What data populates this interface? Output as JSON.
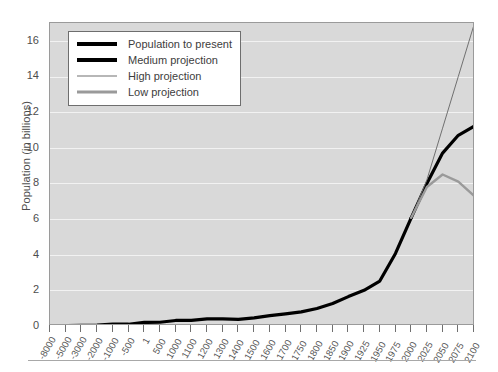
{
  "chart_data": {
    "type": "line",
    "title": "",
    "xlabel": "",
    "ylabel": "Population (in billions)",
    "ylim": [
      0,
      17
    ],
    "yticks": [
      0,
      2,
      4,
      6,
      8,
      10,
      12,
      14,
      16
    ],
    "grid": true,
    "legend_position": "top-left",
    "categories": [
      "-8000",
      "-5000",
      "-3000",
      "-2000",
      "-1000",
      "-500",
      "1",
      "500",
      "1000",
      "1100",
      "1200",
      "1300",
      "1400",
      "1500",
      "1600",
      "1700",
      "1750",
      "1800",
      "1850",
      "1900",
      "1925",
      "1950",
      "1975",
      "2000",
      "2025",
      "2050",
      "2075",
      "2100"
    ],
    "series": [
      {
        "name": "Population to present",
        "color": "#000000",
        "width": 3.2,
        "values": [
          0.005,
          0.02,
          0.04,
          0.05,
          0.1,
          0.1,
          0.2,
          0.21,
          0.31,
          0.32,
          0.4,
          0.4,
          0.37,
          0.46,
          0.58,
          0.68,
          0.79,
          0.98,
          1.26,
          1.65,
          2.0,
          2.52,
          4.07,
          6.07,
          null,
          null,
          null,
          null
        ]
      },
      {
        "name": "Medium projection",
        "color": "#000000",
        "width": 3.2,
        "values": [
          null,
          null,
          null,
          null,
          null,
          null,
          null,
          null,
          null,
          null,
          null,
          null,
          null,
          null,
          null,
          null,
          null,
          null,
          null,
          null,
          null,
          null,
          null,
          6.07,
          8.0,
          9.7,
          10.7,
          11.2
        ]
      },
      {
        "name": "High projection",
        "color": "#707070",
        "width": 1,
        "values": [
          null,
          null,
          null,
          null,
          null,
          null,
          null,
          null,
          null,
          null,
          null,
          null,
          null,
          null,
          null,
          null,
          null,
          null,
          null,
          null,
          null,
          null,
          null,
          6.07,
          8.2,
          11.1,
          14.0,
          16.9
        ]
      },
      {
        "name": "Low projection",
        "color": "#9a9a9a",
        "width": 2.4,
        "values": [
          null,
          null,
          null,
          null,
          null,
          null,
          null,
          null,
          null,
          null,
          null,
          null,
          null,
          null,
          null,
          null,
          null,
          null,
          null,
          null,
          null,
          null,
          null,
          6.07,
          7.8,
          8.5,
          8.1,
          7.3
        ]
      }
    ]
  },
  "legend": {
    "items": [
      {
        "label": "Population to present"
      },
      {
        "label": "Medium projection"
      },
      {
        "label": "High projection"
      },
      {
        "label": "Low projection"
      }
    ]
  },
  "axes": {
    "y_title": "Population (in billions)"
  }
}
